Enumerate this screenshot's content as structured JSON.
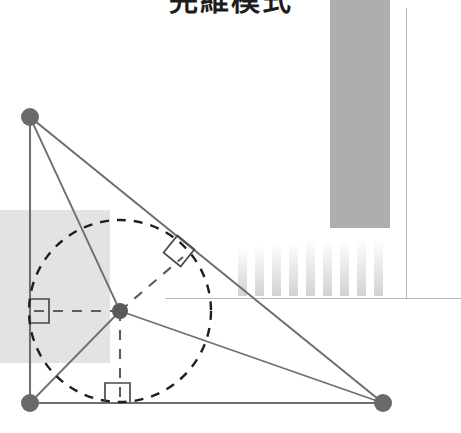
{
  "page": {
    "title_text": "完維模式",
    "width": 461,
    "height": 433,
    "background_color": "#ffffff"
  },
  "colors": {
    "stroke_line": "#6f6f6f",
    "dashed_circle": "#1f1f1f",
    "dashed_radius": "#5d5d5d",
    "vertex_dot": "#6a6a6a",
    "right_angle_mark": "#4a4a4a",
    "panel_gray": "#aeaeae",
    "shade_gray": "#e3e3e3",
    "rule_gray": "#b9b9b9"
  },
  "figure": {
    "name": "right-triangle-with-inscribed-circle",
    "vertices": [
      {
        "label": "A",
        "role": "apex-top-left",
        "x": 30,
        "y": 117
      },
      {
        "label": "B",
        "role": "right-angle-bottom-left",
        "x": 30,
        "y": 403
      },
      {
        "label": "C",
        "role": "bottom-right",
        "x": 383,
        "y": 403
      }
    ],
    "edges": [
      {
        "name": "leg-vertical-AB",
        "from": "A",
        "to": "B"
      },
      {
        "name": "leg-horizontal-BC",
        "from": "B",
        "to": "C"
      },
      {
        "name": "hypotenuse-AC",
        "from": "A",
        "to": "C"
      }
    ],
    "incircle": {
      "center_x": 120,
      "center_y": 311,
      "radius": 91,
      "style": "dashed"
    },
    "incenter": {
      "label": "I",
      "x": 120,
      "y": 311
    },
    "tangent_points": [
      {
        "name": "tangent-left-leg",
        "x": 30,
        "y": 311
      },
      {
        "name": "tangent-base",
        "x": 120,
        "y": 403
      },
      {
        "name": "tangent-hypotenuse",
        "x": 183,
        "y": 257
      }
    ],
    "radii": [
      {
        "name": "radius-to-left-leg",
        "to": "tangent-left-leg"
      },
      {
        "name": "radius-to-base",
        "to": "tangent-base"
      },
      {
        "name": "radius-to-hypotenuse",
        "to": "tangent-hypotenuse"
      }
    ],
    "bisectors": [
      {
        "name": "bisector-from-A",
        "from": "A",
        "to": "I"
      },
      {
        "name": "bisector-from-C",
        "from": "C",
        "to": "I"
      },
      {
        "name": "bisector-from-B",
        "from": "B",
        "to": "I"
      }
    ],
    "right_angle_marks": [
      {
        "name": "right-angle-at-left-leg",
        "x": 30,
        "y": 311,
        "rotation_deg": 0
      },
      {
        "name": "right-angle-at-base",
        "x": 120,
        "y": 403,
        "rotation_deg": 0
      },
      {
        "name": "right-angle-at-hypotenuse",
        "x": 183,
        "y": 257,
        "rotation_deg": 39
      }
    ]
  },
  "background": {
    "panel": {
      "name": "gray-panel",
      "x": 330,
      "y": -8,
      "width": 60,
      "height": 236,
      "color": "#aeaeae"
    },
    "shade": {
      "name": "shaded-region",
      "x": 0,
      "y": 210,
      "width": 110,
      "height": 153,
      "color": "#e3e3e3"
    },
    "bars": {
      "name": "gradient-bars",
      "count": 9,
      "x": 238,
      "y": 240,
      "width": 152,
      "height": 56
    },
    "rules": [
      {
        "name": "horizontal-rule",
        "x": 165,
        "y": 298,
        "length": 296,
        "orientation": "horizontal"
      },
      {
        "name": "vertical-rule",
        "x": 406,
        "y": 8,
        "length": 290,
        "orientation": "vertical"
      }
    ]
  }
}
